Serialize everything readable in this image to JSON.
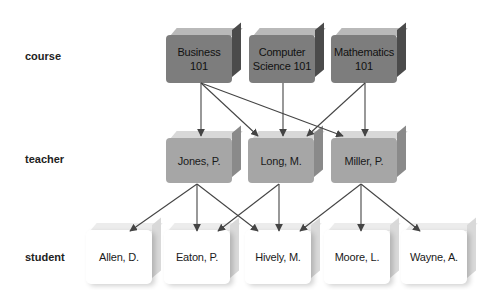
{
  "row_labels": {
    "course": "course",
    "teacher": "teacher",
    "student": "student"
  },
  "courses": [
    {
      "id": "business",
      "label": "Business 101",
      "line1": "Business",
      "line2": "101"
    },
    {
      "id": "cs",
      "label": "Computer Science 101",
      "line1": "Computer",
      "line2": "Science 101"
    },
    {
      "id": "math",
      "label": "Mathematics 101",
      "line1": "Mathematics",
      "line2": "101"
    }
  ],
  "teachers": [
    {
      "id": "jones",
      "label": "Jones, P."
    },
    {
      "id": "long",
      "label": "Long, M."
    },
    {
      "id": "miller",
      "label": "Miller, P."
    }
  ],
  "students": [
    {
      "id": "allen",
      "label": "Allen, D."
    },
    {
      "id": "eaton",
      "label": "Eaton, P."
    },
    {
      "id": "hively",
      "label": "Hively, M."
    },
    {
      "id": "moore",
      "label": "Moore, L."
    },
    {
      "id": "wayne",
      "label": "Wayne, A."
    }
  ],
  "edges": [
    {
      "from": "Business 101",
      "to": "Jones, P."
    },
    {
      "from": "Business 101",
      "to": "Long, M."
    },
    {
      "from": "Business 101",
      "to": "Miller, P."
    },
    {
      "from": "Computer Science 101",
      "to": "Long, M."
    },
    {
      "from": "Mathematics 101",
      "to": "Long, M."
    },
    {
      "from": "Mathematics 101",
      "to": "Miller, P."
    },
    {
      "from": "Jones, P.",
      "to": "Allen, D."
    },
    {
      "from": "Jones, P.",
      "to": "Eaton, P."
    },
    {
      "from": "Jones, P.",
      "to": "Hively, M."
    },
    {
      "from": "Long, M.",
      "to": "Eaton, P."
    },
    {
      "from": "Long, M.",
      "to": "Hively, M."
    },
    {
      "from": "Miller, P.",
      "to": "Hively, M."
    },
    {
      "from": "Miller, P.",
      "to": "Moore, L."
    },
    {
      "from": "Miller, P.",
      "to": "Wayne, A."
    }
  ],
  "colors": {
    "course_fill": "#7d7d7d",
    "teacher_fill": "#a6a6a6",
    "student_fill": "#ffffff",
    "edge": "#444444"
  }
}
